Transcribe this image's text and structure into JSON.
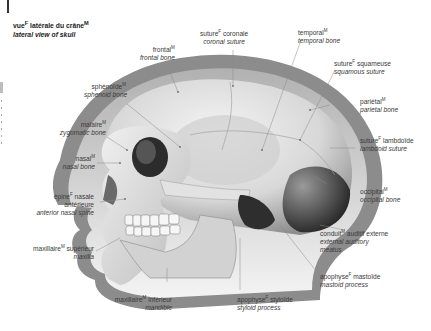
{
  "title": {
    "fr": "vue",
    "fr_gender": "F",
    "fr_rest": " latérale du crâne",
    "fr_rest_gender": "M",
    "en": "lateral view of skull"
  },
  "labels": [
    {
      "id": "frontal",
      "fr": "frontal",
      "gender": "M",
      "en": "frontal bone"
    },
    {
      "id": "coronal-suture",
      "fr": "suture",
      "gender": "F",
      "fr_rest": " coronale",
      "en": "coronal suture"
    },
    {
      "id": "temporal",
      "fr": "temporal",
      "gender": "M",
      "en": "temporal bone"
    },
    {
      "id": "squamous-suture",
      "fr": "suture",
      "gender": "F",
      "fr_rest": " squameuse",
      "en": "squamous suture"
    },
    {
      "id": "sphenoid",
      "fr": "sphénoïde",
      "gender": "M",
      "en": "sphenoid bone"
    },
    {
      "id": "parietal",
      "fr": "pariétal",
      "gender": "M",
      "en": "parietal bone"
    },
    {
      "id": "zygomatic",
      "fr": "malaire",
      "gender": "M",
      "en": "zygomatic bone"
    },
    {
      "id": "lambdoid-suture",
      "fr": "suture",
      "gender": "F",
      "fr_rest": " lambdoïde",
      "en": "lambdoid suture"
    },
    {
      "id": "nasal",
      "fr": "nasal",
      "gender": "M",
      "en": "nasal bone"
    },
    {
      "id": "anterior-nasal-spine",
      "fr": "épine",
      "gender": "F",
      "fr_rest": " nasale",
      "fr_line2": "antérieure",
      "en": "anterior nasal spine"
    },
    {
      "id": "occipital",
      "fr": "occipital",
      "gender": "M",
      "en": "occipital bone"
    },
    {
      "id": "external-auditory-meatus",
      "fr": "conduit",
      "gender": "M",
      "fr_rest": " auditif externe",
      "en": "external auditory",
      "en_line2": "meatus"
    },
    {
      "id": "maxilla",
      "fr": "maxillaire",
      "gender": "M",
      "fr_rest": " supérieur",
      "en": "maxilla"
    },
    {
      "id": "mastoid-process",
      "fr": "apophyse",
      "gender": "F",
      "fr_rest": " mastoïde",
      "en": "mastoid process"
    },
    {
      "id": "mandible",
      "fr": "maxillaire",
      "gender": "M",
      "fr_rest": " inférieur",
      "en": "mandible"
    },
    {
      "id": "styloid-process",
      "fr": "apophyse",
      "gender": "F",
      "fr_rest": " styloïde",
      "en": "styloid process"
    }
  ],
  "colors": {
    "head_outline": "#8c8c8c",
    "head_fill": "#b9b9b9",
    "bone_light": "#e6e6e6",
    "bone_mid": "#c4c4c4",
    "bone_dark": "#3a3a3a",
    "leader_line": "#8a8a8a",
    "text": "#3a3a3a"
  }
}
